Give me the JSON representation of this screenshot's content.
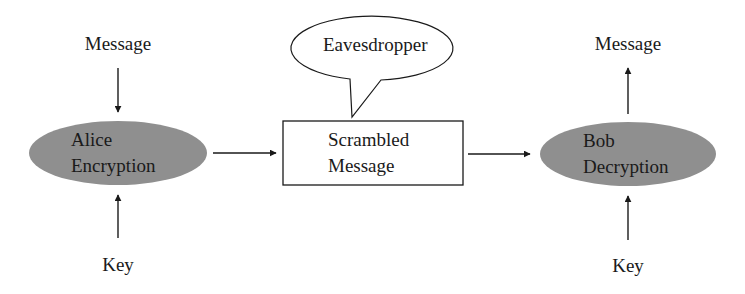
{
  "diagram": {
    "title": "",
    "colors": {
      "node_fill": "#8f8f8f",
      "stroke": "#1a1a1a",
      "background": "#ffffff"
    },
    "nodes": {
      "alice": {
        "line1": "Alice",
        "line2": "Encryption",
        "shape": "ellipse",
        "filled": true
      },
      "scrambled": {
        "line1": "Scrambled",
        "line2": "Message",
        "shape": "rectangle",
        "filled": false
      },
      "bob": {
        "line1": "Bob",
        "line2": "Decryption",
        "shape": "ellipse",
        "filled": true
      },
      "eavesdropper": {
        "label": "Eavesdropper",
        "shape": "speech-bubble"
      }
    },
    "labels": {
      "alice_input_message": "Message",
      "alice_input_key": "Key",
      "bob_output_message": "Message",
      "bob_input_key": "Key"
    },
    "edges": [
      {
        "from": "Message",
        "to": "Alice Encryption"
      },
      {
        "from": "Key",
        "to": "Alice Encryption"
      },
      {
        "from": "Alice Encryption",
        "to": "Scrambled Message"
      },
      {
        "from": "Scrambled Message",
        "to": "Bob Decryption"
      },
      {
        "from": "Key",
        "to": "Bob Decryption"
      },
      {
        "from": "Bob Decryption",
        "to": "Message"
      },
      {
        "from": "Eavesdropper",
        "to": "Scrambled Message",
        "style": "speech-bubble-tail"
      }
    ]
  }
}
